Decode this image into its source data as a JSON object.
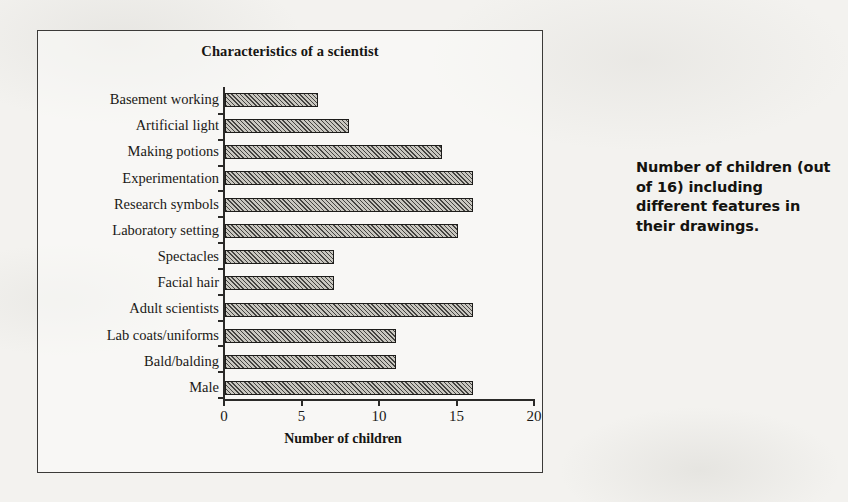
{
  "figure": {
    "chart_title": "Characteristics of a scientist",
    "x_axis_title": "Number of children",
    "side_caption": "Number of children (out of 16) including different features in their drawings."
  },
  "chart_data": {
    "type": "bar",
    "orientation": "horizontal",
    "title": "Characteristics of a scientist",
    "xlabel": "Number of children",
    "ylabel": "",
    "xlim": [
      0,
      20
    ],
    "xticks": [
      "0",
      "5",
      "10",
      "15",
      "20"
    ],
    "grid": false,
    "legend": "none",
    "categories": [
      "Basement working",
      "Artificial light",
      "Making potions",
      "Experimentation",
      "Research symbols",
      "Laboratory setting",
      "Spectacles",
      "Facial hair",
      "Adult scientists",
      "Lab coats/uniforms",
      "Bald/balding",
      "Male"
    ],
    "values": [
      6,
      8,
      14,
      16,
      16,
      15,
      7,
      7,
      16,
      11,
      11,
      16
    ],
    "annotation": "Number of children (out of 16) including different features in their drawings."
  },
  "colors": {
    "bar_fill": "#c9c7c0",
    "bar_edge": "#1d1c1a",
    "axis": "#2b2a28",
    "text": "#1a1916",
    "page_background": "#f3f2ef"
  }
}
